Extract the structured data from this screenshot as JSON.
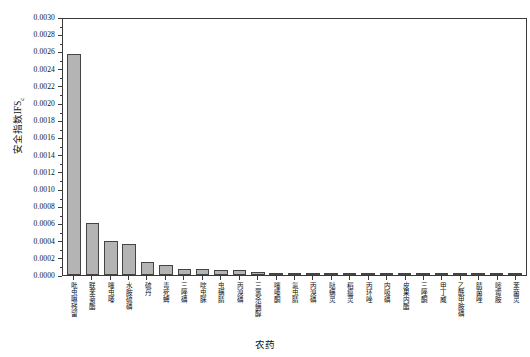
{
  "chart_data": {
    "type": "bar",
    "title": "",
    "xlabel": "农药",
    "ylabel": "安全指数IFS",
    "ylabel_sub": "c",
    "ylim": [
      0,
      0.003
    ],
    "ytick_step": 0.0002,
    "grid": false,
    "legend": "none",
    "bar_color": "#b4b4b4",
    "bar_edge_color": "#444444",
    "ytick_labels": [
      "0.0030",
      "0.0028",
      "0.0026",
      "0.0024",
      "0.0022",
      "0.0020",
      "0.0018",
      "0.0016",
      "0.0014",
      "0.0012",
      "0.0010",
      "0.0008",
      "0.0006",
      "0.0004",
      "0.0002",
      "0.0000"
    ],
    "ytick_values": [
      0.003,
      0.0028,
      0.0026,
      0.0024,
      0.0022,
      0.002,
      0.0018,
      0.0016,
      0.0014,
      0.0012,
      0.001,
      0.0008,
      0.0006,
      0.0004,
      0.0002,
      0.0
    ],
    "categories": [
      "吡虫啉残留",
      "联苯菊酯",
      "噻虫嗪",
      "水胺硫磷",
      "硫丹",
      "毒死蜱",
      "三唑磷",
      "啶虫脒",
      "虫螨腈",
      "丙溴磷",
      "三氯杀螨醇",
      "噻嗪酮",
      "氟虫腈",
      "丙溴磷",
      "哒螨灵",
      "稻瘟灵",
      "丙环唑",
      "内吸磷",
      "皮果内酯",
      "三唑酮",
      "甲丁威",
      "乙酰甲胺磷",
      "腈菌唑",
      "嘧霉胺",
      "苯菌灵"
    ],
    "values": [
      0.00257,
      0.0006,
      0.00039,
      0.00036,
      0.00015,
      0.00012,
      7.5e-05,
      7e-05,
      6.2e-05,
      5.8e-05,
      3e-05,
      2.4e-05,
      1.8e-05,
      1.4e-05,
      1e-05,
      8e-06,
      6e-06,
      5e-06,
      4e-06,
      3e-06,
      3e-06,
      2e-06,
      2e-06,
      1e-06,
      1e-06
    ]
  }
}
